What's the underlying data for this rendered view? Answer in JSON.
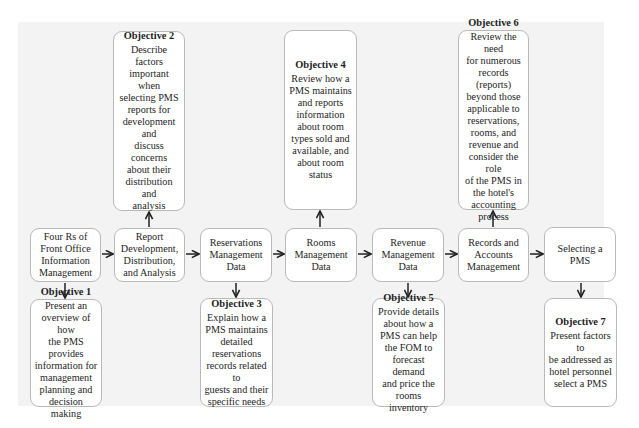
{
  "diagram": {
    "main_flow": [
      {
        "id": "four-rs",
        "label": "Four Rs of\nFront Office\nInformation\nManagement"
      },
      {
        "id": "report-dev",
        "label": "Report\nDevelopment,\nDistribution,\nand Analysis"
      },
      {
        "id": "reservations",
        "label": "Reservations\nManagement\nData"
      },
      {
        "id": "rooms",
        "label": "Rooms\nManagement\nData"
      },
      {
        "id": "revenue",
        "label": "Revenue\nManagement\nData"
      },
      {
        "id": "records",
        "label": "Records and\nAccounts\nManagement"
      },
      {
        "id": "selecting",
        "label": "Selecting a\nPMS"
      }
    ],
    "objectives": [
      {
        "title": "Objective 1",
        "text": "Present an\noverview of how\nthe PMS provides\ninformation for\nmanagement\nplanning and\ndecision making",
        "attached_to": "four-rs",
        "position": "below"
      },
      {
        "title": "Objective 2",
        "text": "Describe factors\nimportant when\nselecting PMS\nreports for\ndevelopment and\ndiscuss concerns\nabout their\ndistribution and\nanalysis",
        "attached_to": "report-dev",
        "position": "above"
      },
      {
        "title": "Objective 3",
        "text": "Explain how a\nPMS maintains\ndetailed\nreservations\nrecords related to\nguests and their\nspecific needs",
        "attached_to": "reservations",
        "position": "below"
      },
      {
        "title": "Objective 4",
        "text": "Review how a\nPMS maintains\nand reports\ninformation\nabout room\ntypes sold and\navailable, and\nabout room\nstatus",
        "attached_to": "rooms",
        "position": "above"
      },
      {
        "title": "Objective 5",
        "text": "Provide details\nabout how a\nPMS can help\nthe FOM to\nforecast demand\nand price the\nrooms inventory",
        "attached_to": "revenue",
        "position": "below"
      },
      {
        "title": "Objective 6",
        "text": "Review the need\nfor numerous\nrecords (reports)\nbeyond those\napplicable to\nreservations,\nrooms, and\nrevenue and\nconsider the role\nof the PMS in\nthe hotel's\naccounting\nprocess",
        "attached_to": "records",
        "position": "above"
      },
      {
        "title": "Objective 7",
        "text": "Present factors to\nbe addressed as\nhotel personnel\nselect a PMS",
        "attached_to": "selecting",
        "position": "below"
      }
    ],
    "colors": {
      "background_panel": "#f3f3f3",
      "box_fill": "#ffffff",
      "box_border": "#b9b9b9",
      "arrow": "#222222"
    }
  }
}
